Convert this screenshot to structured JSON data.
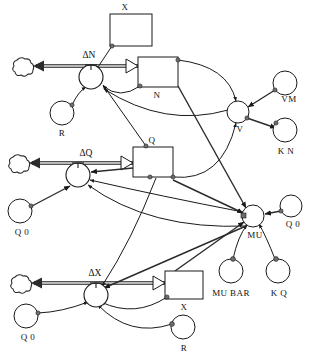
{
  "diagram": {
    "type": "system-dynamics-stock-and-flow",
    "canvas": {
      "width": 315,
      "height": 362
    },
    "stocks": [
      {
        "id": "x_top",
        "label": "X",
        "x": 110,
        "y": 14,
        "w": 42,
        "h": 32,
        "label_pos": "above"
      },
      {
        "id": "n",
        "label": "N",
        "x": 138,
        "y": 57,
        "w": 40,
        "h": 30,
        "label_pos": "below"
      },
      {
        "id": "q",
        "label": "Q",
        "x": 133,
        "y": 147,
        "w": 40,
        "h": 30,
        "label_pos": "above"
      },
      {
        "id": "x_bot",
        "label": "X",
        "x": 165,
        "y": 271,
        "w": 38,
        "h": 28,
        "label_pos": "below"
      }
    ],
    "flows": [
      {
        "id": "dn",
        "label": "ΔN",
        "valve_x": 91,
        "valve_y": 77,
        "sink_x": 24,
        "sink_y": 66,
        "stock": "n"
      },
      {
        "id": "dq",
        "label": "ΔQ",
        "valve_x": 78,
        "valve_y": 175,
        "sink_x": 20,
        "sink_y": 163,
        "stock": "q"
      },
      {
        "id": "dx",
        "label": "ΔX",
        "valve_x": 96,
        "valve_y": 295,
        "sink_x": 22,
        "sink_y": 283,
        "stock": "x_bot"
      }
    ],
    "auxiliaries": [
      {
        "id": "r_top",
        "label": "R",
        "cx": 62,
        "cy": 113,
        "r": 12,
        "label_pos": "below"
      },
      {
        "id": "v",
        "label": "V",
        "cx": 238,
        "cy": 112,
        "r": 11,
        "label_pos": "below"
      },
      {
        "id": "vm",
        "label": "VM",
        "cx": 285,
        "cy": 83,
        "r": 12,
        "label_pos": "below-right"
      },
      {
        "id": "kn",
        "label": "K N",
        "cx": 285,
        "cy": 130,
        "r": 12,
        "label_pos": "below"
      },
      {
        "id": "q0_left1",
        "label": "Q 0",
        "cx": 20,
        "cy": 211,
        "r": 12,
        "label_pos": "below"
      },
      {
        "id": "mu",
        "label": "MU",
        "cx": 253,
        "cy": 216,
        "r": 11,
        "label_pos": "below"
      },
      {
        "id": "q0_right",
        "label": "Q 0",
        "cx": 291,
        "cy": 206,
        "r": 11,
        "label_pos": "below"
      },
      {
        "id": "mubar",
        "label": "MU BAR",
        "cx": 231,
        "cy": 271,
        "r": 12,
        "label_pos": "below"
      },
      {
        "id": "kq",
        "label": "K Q",
        "cx": 278,
        "cy": 271,
        "r": 12,
        "label_pos": "below"
      },
      {
        "id": "q0_left2",
        "label": "Q 0",
        "cx": 26,
        "cy": 316,
        "r": 12,
        "label_pos": "below"
      },
      {
        "id": "r_bot",
        "label": "R",
        "cx": 183,
        "cy": 327,
        "r": 12,
        "label_pos": "below"
      }
    ],
    "clouds": [
      {
        "id": "cloud_n",
        "cx": 24,
        "cy": 66
      },
      {
        "id": "cloud_q",
        "cx": 20,
        "cy": 163
      },
      {
        "id": "cloud_x",
        "cx": 22,
        "cy": 283
      }
    ],
    "connections": [
      {
        "from": "x_top",
        "to": "dn",
        "kind": "info"
      },
      {
        "from": "r_top",
        "to": "dn",
        "kind": "info"
      },
      {
        "from": "n",
        "to": "dn",
        "kind": "info"
      },
      {
        "from": "v",
        "to": "dn",
        "kind": "info"
      },
      {
        "from": "q",
        "to": "dn",
        "kind": "info"
      },
      {
        "from": "n",
        "to": "v",
        "kind": "info"
      },
      {
        "from": "vm",
        "to": "v",
        "kind": "info"
      },
      {
        "from": "v",
        "to": "kn",
        "kind": "info"
      },
      {
        "from": "q",
        "to": "v",
        "kind": "info"
      },
      {
        "from": "q0_left1",
        "to": "dq",
        "kind": "info"
      },
      {
        "from": "q",
        "to": "dq",
        "kind": "info"
      },
      {
        "from": "mu",
        "to": "dq",
        "kind": "info"
      },
      {
        "from": "q0_right",
        "to": "mu",
        "kind": "info"
      },
      {
        "from": "mu",
        "to": "mubar",
        "kind": "info"
      },
      {
        "from": "mu",
        "to": "kq",
        "kind": "info"
      },
      {
        "from": "n",
        "to": "mu",
        "kind": "info"
      },
      {
        "from": "q",
        "to": "mu",
        "kind": "info"
      },
      {
        "from": "x_bot",
        "to": "mu",
        "kind": "info"
      },
      {
        "from": "q0_left2",
        "to": "dx",
        "kind": "info"
      },
      {
        "from": "x_bot",
        "to": "dx",
        "kind": "info"
      },
      {
        "from": "r_bot",
        "to": "dx",
        "kind": "info"
      },
      {
        "from": "mu",
        "to": "dx",
        "kind": "info"
      },
      {
        "from": "dn",
        "to": "cloud_n",
        "kind": "flow"
      },
      {
        "from": "dq",
        "to": "cloud_q",
        "kind": "flow"
      },
      {
        "from": "dx",
        "to": "cloud_x",
        "kind": "flow"
      }
    ],
    "labels": {
      "x_top": "X",
      "n": "N",
      "q": "Q",
      "x_bot": "X",
      "delta_n": "ΔN",
      "delta_q": "ΔQ",
      "delta_x": "ΔX",
      "r_top": "R",
      "v": "V",
      "vm": "VM",
      "kn": "K N",
      "q0_a": "Q 0",
      "q0_b": "Q 0",
      "q0_c": "Q 0",
      "mu": "MU",
      "mu_bar": "MU BAR",
      "kq": "K Q",
      "r_bot": "R"
    },
    "colors": {
      "stroke": "#1a1a1a",
      "flow_pipe": "#555555",
      "flow_inner": "#d9d9d9",
      "fill": "#ffffff",
      "handle": "#6e6e6e"
    }
  }
}
